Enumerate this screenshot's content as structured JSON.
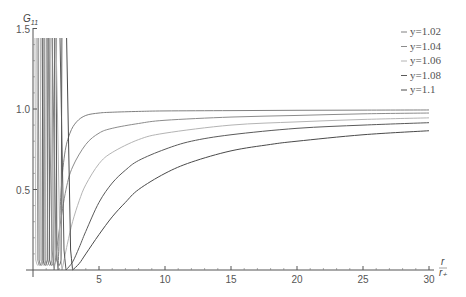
{
  "chart_data": {
    "type": "line",
    "title": "",
    "xlabel": "r / r_+",
    "ylabel": "G_11",
    "xlim": [
      0,
      30
    ],
    "ylim": [
      0,
      1.5
    ],
    "grid": false,
    "legend_position": "top-right",
    "x_ticks": [
      5,
      10,
      15,
      20,
      25,
      30
    ],
    "y_ticks": [
      0.5,
      1.0,
      1.5
    ],
    "y_tick_labels": [
      "0.5",
      "1.0",
      "1.5"
    ],
    "x_tick_labels": [
      "5",
      "10",
      "15",
      "20",
      "25",
      "30"
    ],
    "series": [
      {
        "name": "y=1.02",
        "color": "#808080",
        "x": [
          1.9,
          2.1,
          2.4,
          2.8,
          3.3,
          4,
          5,
          6,
          8,
          10,
          15,
          20,
          25,
          30
        ],
        "y": [
          0.0,
          0.45,
          0.72,
          0.85,
          0.92,
          0.96,
          0.975,
          0.98,
          0.985,
          0.988,
          0.99,
          0.992,
          0.993,
          0.994
        ]
      },
      {
        "name": "y=1.04",
        "color": "#8c8c8c",
        "x": [
          1.6,
          2.0,
          2.5,
          3,
          4,
          5,
          6,
          8,
          10,
          15,
          20,
          25,
          30
        ],
        "y": [
          0.0,
          0.25,
          0.5,
          0.64,
          0.78,
          0.85,
          0.88,
          0.91,
          0.93,
          0.95,
          0.96,
          0.97,
          0.975
        ]
      },
      {
        "name": "y=1.06",
        "color": "#b4b4b4",
        "x": [
          2.2,
          2.6,
          3,
          3.5,
          4,
          5,
          6,
          8,
          10,
          15,
          20,
          25,
          30
        ],
        "y": [
          0.0,
          0.16,
          0.3,
          0.43,
          0.53,
          0.66,
          0.73,
          0.81,
          0.85,
          0.9,
          0.92,
          0.935,
          0.945
        ]
      },
      {
        "name": "y=1.08",
        "color": "#5a5a5a",
        "x": [
          2.5,
          3,
          3.5,
          4,
          5,
          6,
          7,
          8,
          10,
          12,
          15,
          20,
          25,
          30
        ],
        "y": [
          0.0,
          0.05,
          0.14,
          0.24,
          0.42,
          0.54,
          0.62,
          0.68,
          0.75,
          0.8,
          0.84,
          0.88,
          0.9,
          0.915
        ]
      },
      {
        "name": "y=1.1",
        "color": "#4a4a4a",
        "x": [
          3.0,
          3.5,
          4,
          5,
          6,
          7,
          8,
          10,
          12,
          15,
          18,
          20,
          25,
          30
        ],
        "y": [
          0.0,
          0.04,
          0.1,
          0.22,
          0.33,
          0.42,
          0.5,
          0.6,
          0.67,
          0.74,
          0.78,
          0.8,
          0.84,
          0.865
        ]
      }
    ],
    "near_origin_note": "all curves oscillate with divergent spikes (clipped at top) for r/r_+ < ~2"
  },
  "axes": {
    "y_label_main": "G",
    "y_label_sub": "11",
    "x_label_num": "r",
    "x_label_den": "r₊"
  },
  "legend": {
    "items": [
      {
        "label": "y=1.02",
        "color": "#808080"
      },
      {
        "label": "y=1.04",
        "color": "#8c8c8c"
      },
      {
        "label": "y=1.06",
        "color": "#b4b4b4"
      },
      {
        "label": "y=1.08",
        "color": "#5a5a5a"
      },
      {
        "label": "y=1.1",
        "color": "#4a4a4a"
      }
    ]
  },
  "spikes": {
    "x": [
      0.3,
      0.45,
      0.55,
      0.7,
      0.85,
      1.0,
      1.2,
      1.35,
      1.5,
      1.9
    ],
    "colors": [
      "#b4b4b4",
      "#8c8c8c",
      "#808080",
      "#b4b4b4",
      "#5a5a5a",
      "#8c8c8c",
      "#808080",
      "#5a5a5a",
      "#b4b4b4",
      "#4a4a4a"
    ]
  }
}
